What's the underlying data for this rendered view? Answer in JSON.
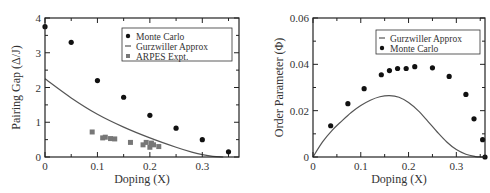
{
  "chart_data": [
    {
      "type": "scatter",
      "title": "",
      "xlabel": "Doping (X)",
      "ylabel": "Pairing Gap (Δ/J)",
      "xlim": [
        0,
        0.37
      ],
      "ylim": [
        0,
        4
      ],
      "xticks": [
        "0",
        "0.1",
        "0.2",
        "0.3"
      ],
      "yticks": [
        "0",
        "1",
        "2",
        "3",
        "4"
      ],
      "xtick_values": [
        0,
        0.1,
        0.2,
        0.3
      ],
      "ytick_values": [
        0,
        1,
        2,
        3,
        4
      ],
      "grid": false,
      "legend_position": "top-right",
      "legend": [
        "Monte Carlo",
        "Gurzwiller Approx",
        "ARPES Expt."
      ],
      "series": [
        {
          "name": "Monte Carlo",
          "kind": "scatter",
          "marker": "circle",
          "x": [
            0.0,
            0.05,
            0.1,
            0.15,
            0.2,
            0.25,
            0.3,
            0.35
          ],
          "y": [
            3.75,
            3.3,
            2.2,
            1.72,
            1.2,
            0.83,
            0.5,
            0.15
          ]
        },
        {
          "name": "Gurzwiller Approx",
          "kind": "line",
          "x": [
            0.0,
            0.05,
            0.1,
            0.15,
            0.2,
            0.25,
            0.28,
            0.3,
            0.32,
            0.34
          ],
          "y": [
            2.25,
            1.7,
            1.23,
            0.86,
            0.55,
            0.28,
            0.14,
            0.07,
            0.02,
            0.0
          ]
        },
        {
          "name": "ARPES Expt.",
          "kind": "scatter",
          "marker": "square",
          "x": [
            0.09,
            0.11,
            0.115,
            0.125,
            0.133,
            0.163,
            0.187,
            0.193,
            0.2,
            0.203,
            0.207,
            0.217
          ],
          "y": [
            0.72,
            0.55,
            0.57,
            0.53,
            0.52,
            0.42,
            0.35,
            0.42,
            0.28,
            0.4,
            0.35,
            0.3
          ]
        }
      ]
    },
    {
      "type": "scatter",
      "title": "",
      "xlabel": "Doping (X)",
      "ylabel": "Order Parameter (Φ)",
      "xlim": [
        0,
        0.36
      ],
      "ylim": [
        0,
        0.06
      ],
      "xticks": [
        "0",
        "0.1",
        "0.2",
        "0.3"
      ],
      "yticks": [
        "0",
        "0.02",
        "0.04",
        "0.06"
      ],
      "xtick_values": [
        0,
        0.1,
        0.2,
        0.3
      ],
      "ytick_values": [
        0,
        0.02,
        0.04,
        0.06
      ],
      "grid": false,
      "legend_position": "top-right",
      "legend": [
        "Gurzwiller Approx",
        "Monte Carlo"
      ],
      "series": [
        {
          "name": "Gurzwiller Approx",
          "kind": "line",
          "x": [
            0.0,
            0.02,
            0.04,
            0.06,
            0.08,
            0.1,
            0.12,
            0.14,
            0.16,
            0.18,
            0.2,
            0.22,
            0.24,
            0.26,
            0.28,
            0.3,
            0.32,
            0.34,
            0.35
          ],
          "y": [
            0.0,
            0.0065,
            0.0115,
            0.0155,
            0.0192,
            0.0222,
            0.0245,
            0.026,
            0.0265,
            0.0258,
            0.0235,
            0.02,
            0.0155,
            0.0108,
            0.0065,
            0.0032,
            0.0012,
            0.0002,
            0.0
          ]
        },
        {
          "name": "Monte Carlo",
          "kind": "scatter",
          "marker": "circle",
          "x": [
            0.037,
            0.073,
            0.107,
            0.143,
            0.16,
            0.177,
            0.195,
            0.213,
            0.25,
            0.285,
            0.32,
            0.337,
            0.355,
            0.36
          ],
          "y": [
            0.0135,
            0.023,
            0.0295,
            0.0355,
            0.0373,
            0.0382,
            0.0382,
            0.039,
            0.0385,
            0.0348,
            0.027,
            0.0165,
            0.0075,
            0.0
          ]
        }
      ]
    }
  ]
}
